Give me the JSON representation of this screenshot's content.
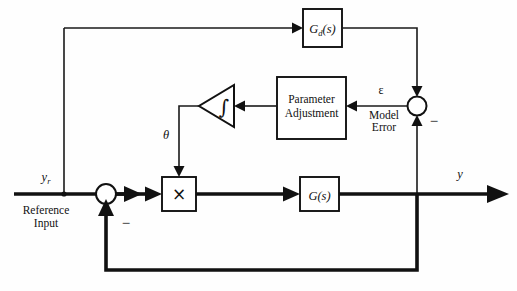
{
  "diagram": {
    "type": "control-system-block-diagram",
    "colors": {
      "line": "#111111",
      "background": "#ffffff",
      "text": "#111111"
    },
    "blocks": {
      "reference_model": {
        "label": "G",
        "subscript": "d",
        "suffix": "(s)",
        "full_label": "Gd(s)"
      },
      "parameter_adjustment": {
        "line1": "Parameter",
        "line2": "Adjustment"
      },
      "integrator": {
        "symbol": "∫"
      },
      "multiplier": {
        "symbol": "×"
      },
      "plant": {
        "label": "G",
        "suffix": "(s)",
        "full_label": "G(s)"
      }
    },
    "labels": {
      "reference_signal": "y",
      "reference_signal_sub": "r",
      "reference_input_line1": "Reference",
      "reference_input_line2": "Input",
      "theta": "θ",
      "epsilon": "ε",
      "model_error_line1": "Model",
      "model_error_line2": "Error",
      "output": "y",
      "minus_feedback": "−",
      "minus_model": "−"
    }
  }
}
